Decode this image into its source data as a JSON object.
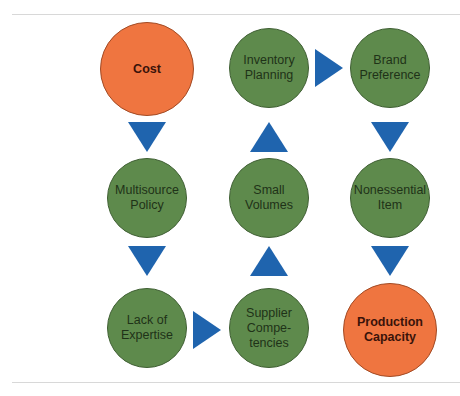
{
  "diagram": {
    "colors": {
      "start_end": "#ef7540",
      "intermediate": "#5e8a4c",
      "arrow": "#1f64ae"
    },
    "nodes": [
      {
        "id": "cost",
        "label": "Cost",
        "type": "start"
      },
      {
        "id": "multisource",
        "label": "Multisource\nPolicy",
        "type": "intermediate"
      },
      {
        "id": "lack_expertise",
        "label": "Lack of\nExpertise",
        "type": "intermediate"
      },
      {
        "id": "supplier",
        "label": "Supplier\nCompe-\ntencies",
        "type": "intermediate"
      },
      {
        "id": "small_volumes",
        "label": "Small\nVolumes",
        "type": "intermediate"
      },
      {
        "id": "inventory",
        "label": "Inventory\nPlanning",
        "type": "intermediate"
      },
      {
        "id": "brand",
        "label": "Brand\nPreference",
        "type": "intermediate"
      },
      {
        "id": "nonessential",
        "label": "Nonessential\nItem",
        "type": "intermediate"
      },
      {
        "id": "production",
        "label": "Production\nCapacity",
        "type": "end"
      }
    ],
    "edges": [
      {
        "from": "cost",
        "to": "multisource",
        "direction": "down"
      },
      {
        "from": "multisource",
        "to": "lack_expertise",
        "direction": "down"
      },
      {
        "from": "lack_expertise",
        "to": "supplier",
        "direction": "right"
      },
      {
        "from": "supplier",
        "to": "small_volumes",
        "direction": "up"
      },
      {
        "from": "small_volumes",
        "to": "inventory",
        "direction": "up"
      },
      {
        "from": "inventory",
        "to": "brand",
        "direction": "right"
      },
      {
        "from": "brand",
        "to": "nonessential",
        "direction": "down"
      },
      {
        "from": "nonessential",
        "to": "production",
        "direction": "down"
      }
    ]
  }
}
